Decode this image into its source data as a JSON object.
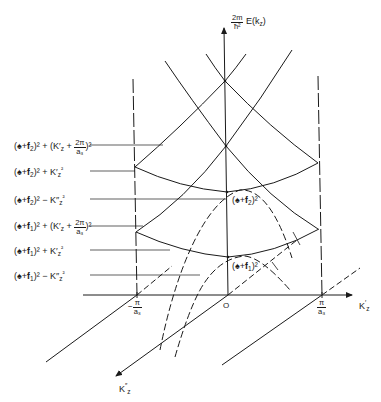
{
  "diagram": {
    "y_axis": {
      "label_frac_num": "2m",
      "label_frac_den": "ħ²",
      "label_rest": "E(k",
      "label_sub": "z",
      "label_close": ")"
    },
    "x_axis": {
      "label": "K",
      "label_sub": "z",
      "label_prime": "′",
      "ticks": {
        "neg_num": "π",
        "neg_den": "a₃",
        "neg_sign": "−",
        "pos_num": "π",
        "pos_den": "a₃"
      },
      "origin": "O"
    },
    "depth_axis": {
      "label": "K",
      "label_sub": "z",
      "label_prime": "″"
    },
    "energy_levels": [
      {
        "id": "level-6",
        "text": "(𝐤+𝐟₂)² + (K′z + 2π/a₃)²",
        "a": "(♠+𝐟",
        "sub": "2",
        "b": ")² + (K′",
        "c": "z",
        "d": " + ",
        "num": "2π",
        "den": "a₃",
        "e": ")²"
      },
      {
        "id": "level-5",
        "text": "(𝐤+𝐟₂)² + K′z²",
        "a": "(♠+𝐟",
        "sub": "2",
        "b": ")² + K′",
        "c": "z",
        "e": "²"
      },
      {
        "id": "level-4",
        "text": "(𝐤+𝐟₂)² − K″z²",
        "a": "(♠+𝐟",
        "sub": "2",
        "b": ")² − K″",
        "c": "z",
        "e": "²"
      },
      {
        "id": "level-3",
        "text": "(𝐤+𝐟₁)² + (K′z + 2π/a₃)²",
        "a": "(♠+𝐟",
        "sub": "1",
        "b": ")² + (K′",
        "c": "z",
        "d": " + ",
        "num": "2π",
        "den": "a₃",
        "e": ")²"
      },
      {
        "id": "level-2",
        "text": "(𝐤+𝐟₁)² + K′z²",
        "a": "(♠+𝐟",
        "sub": "1",
        "b": ")² + K′",
        "c": "z",
        "e": "²"
      },
      {
        "id": "level-1",
        "text": "(𝐤+𝐟₁)² − K″z²",
        "a": "(♠+𝐟",
        "sub": "1",
        "b": ")² − K″",
        "c": "z",
        "e": "²"
      }
    ],
    "minima_labels": [
      {
        "id": "min-2",
        "a": "(♠+𝐟",
        "sub": "2",
        "b": ")²"
      },
      {
        "id": "min-1",
        "a": "(♠+𝐟",
        "sub": "1",
        "b": ")²"
      }
    ],
    "colors": {
      "ink": "#1a1a1a",
      "background": "#ffffff"
    }
  }
}
